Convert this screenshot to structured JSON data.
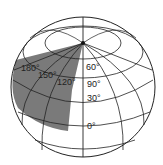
{
  "diagram": {
    "type": "globe-graticule",
    "shaded_region_color": "#7a7a7a",
    "line_color": "#222222",
    "longitude_labels": [
      {
        "text": "180°",
        "x": 21,
        "y": 71
      },
      {
        "text": "150°",
        "x": 38,
        "y": 78
      },
      {
        "text": "120°",
        "x": 57,
        "y": 85
      }
    ],
    "latitude_labels": [
      {
        "text": "60°",
        "x": 86,
        "y": 70
      },
      {
        "text": "90°",
        "x": 87,
        "y": 87
      },
      {
        "text": "30°",
        "x": 87,
        "y": 101
      },
      {
        "text": "0°",
        "x": 87,
        "y": 129
      }
    ]
  }
}
